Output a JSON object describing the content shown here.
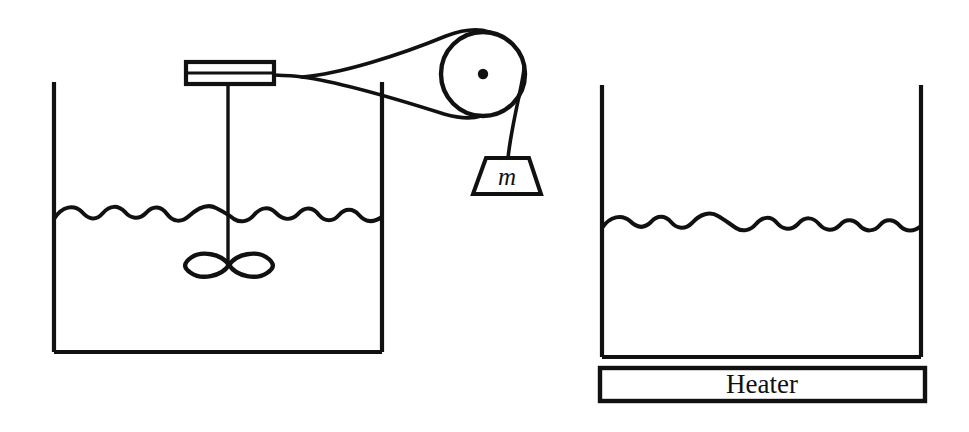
{
  "figure": {
    "background_color": "#ffffff",
    "ink_color": "#111111",
    "width": 969,
    "height": 432
  },
  "labels": {
    "mass_label": "m",
    "heater_label": "Heater"
  },
  "left_apparatus": {
    "name": "paddle-wheel stirred container",
    "container": {
      "left": 54,
      "right": 382,
      "top": 82,
      "bottom": 352,
      "water_level_y": 215
    },
    "spool": {
      "x": 186,
      "y": 62,
      "width": 88,
      "height": 22,
      "divider_y": 73
    },
    "shaft": {
      "x": 228,
      "top": 84,
      "bottom": 266
    },
    "paddle": {
      "center_x": 229,
      "center_y": 265,
      "half_width": 41,
      "half_height": 11
    }
  },
  "pulley_assembly": {
    "name": "pulley with hanging mass",
    "pulley": {
      "center_x": 483,
      "center_y": 74,
      "radius": 42,
      "hub_radius": 5
    },
    "cord": {
      "junction_x": 300,
      "junction_y": 77,
      "upper_tangent_x": 487,
      "upper_tangent_y": 32,
      "lower_tangent_x": 479,
      "lower_tangent_y": 116,
      "drop_x": 508,
      "drop_top": 74,
      "drop_bottom": 158
    },
    "weight": {
      "top_left_x": 486,
      "top_right_x": 529,
      "bottom_left_x": 473,
      "bottom_right_x": 541,
      "top_y": 158,
      "bottom_y": 194
    }
  },
  "right_apparatus": {
    "name": "electrically heated container",
    "container": {
      "left": 602,
      "right": 921,
      "top": 85,
      "bottom": 357,
      "water_level_y": 224
    },
    "heater": {
      "left": 600,
      "right": 925,
      "top": 368,
      "bottom": 401
    }
  }
}
